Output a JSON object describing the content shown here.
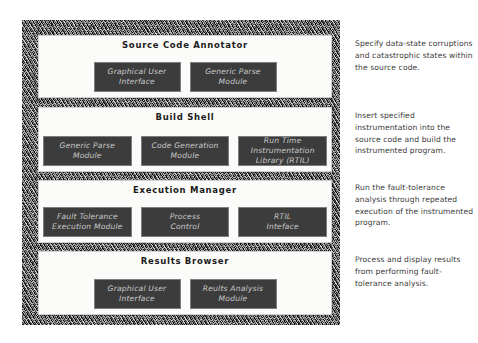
{
  "diagram": {
    "frame": {
      "style_name": "hatched-sketch-border",
      "fill_color": "#8d8d8d"
    },
    "colors": {
      "module_fill": "#3c3c3c",
      "module_text": "#c9c9c9",
      "panel_fill": "#fbfbfa",
      "panel_text": "#1b1b1b",
      "note_text": "#3b3b3b"
    },
    "panels": [
      {
        "id": "source-code-annotator",
        "title": "Source Code Annotator",
        "modules": [
          {
            "id": "graphical-user-interface",
            "line1": "Graphical User",
            "line2": "Interface"
          },
          {
            "id": "generic-parse-module",
            "line1": "Generic Parse",
            "line2": "Module"
          }
        ]
      },
      {
        "id": "build-shell",
        "title": "Build Shell",
        "modules": [
          {
            "id": "generic-parse-module",
            "line1": "Generic Parse",
            "line2": "Module"
          },
          {
            "id": "code-generation-module",
            "line1": "Code Generation",
            "line2": "Module"
          },
          {
            "id": "run-time-instrumentation-library",
            "line1": "Run Time Instrumentation",
            "line2": "Library (RTIL)"
          }
        ]
      },
      {
        "id": "execution-manager",
        "title": "Execution Manager",
        "modules": [
          {
            "id": "fault-tolerance-execution-module",
            "line1": "Fault Tolerance",
            "line2": "Execution Module"
          },
          {
            "id": "process-control",
            "line1": "Process",
            "line2": "Control"
          },
          {
            "id": "rtil-interface",
            "line1": "RTIL",
            "line2": "Inteface"
          }
        ]
      },
      {
        "id": "results-browser",
        "title": "Results Browser",
        "modules": [
          {
            "id": "graphical-user-interface",
            "line1": "Graphical User",
            "line2": "Interface"
          },
          {
            "id": "results-analysis-module",
            "line1": "Reults Analysis",
            "line2": "Module"
          }
        ]
      }
    ],
    "annotations": [
      {
        "id": "note-annotator",
        "text": "Specify data-state corruptions and catastrophic states within the source code."
      },
      {
        "id": "note-build",
        "text": "Insert specified instrumentation into the source code and build the instrumented program."
      },
      {
        "id": "note-execution",
        "text": "Run the fault-tolerance analysis through repeated execution of the instrumented program."
      },
      {
        "id": "note-results",
        "text": "Process and display results from performing fault-tolerance analysis."
      }
    ]
  }
}
